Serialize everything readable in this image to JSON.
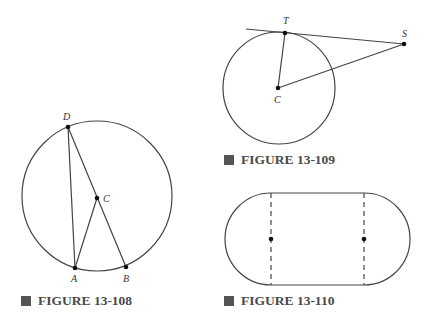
{
  "figures": [
    {
      "caption": "FIGURE 13-108",
      "points": {
        "D": "D",
        "C": "C",
        "A": "A",
        "B": "B"
      }
    },
    {
      "caption": "FIGURE 13-109",
      "points": {
        "T": "T",
        "S": "S",
        "C": "C"
      }
    },
    {
      "caption": "FIGURE 13-110"
    }
  ],
  "colors": {
    "stroke": "#333333",
    "caption": "#4a4a4a",
    "marker": "#555555"
  }
}
